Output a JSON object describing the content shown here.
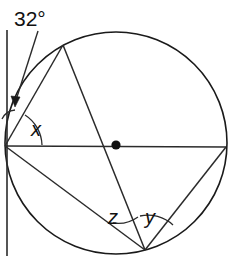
{
  "figure": {
    "width": 232,
    "height": 264,
    "background_color": "#ffffff",
    "stroke_color": "#1a1a1a"
  },
  "labels": {
    "tangent_chord_angle": "32°",
    "angle_x": "x",
    "angle_z": "z",
    "angle_y": "y"
  },
  "geometry": {
    "circle": {
      "center_x": 116,
      "center_y": 143,
      "radius": 111
    },
    "points": {
      "left_vertex": {
        "x": 5,
        "y": 146
      },
      "right_vertex": {
        "x": 226,
        "y": 147
      },
      "top_vertex": {
        "x": 63,
        "y": 45
      },
      "bottom_vertex": {
        "x": 145,
        "y": 250
      },
      "center_dot": {
        "x": 116,
        "y": 145
      }
    },
    "tangent_line": {
      "x": 7,
      "y_top": 30,
      "y_bottom": 256
    },
    "leader_line": {
      "x1": 37,
      "y1": 30,
      "x2": 15,
      "y2": 104
    },
    "arrow_tip": {
      "x": 15,
      "y": 106
    }
  }
}
